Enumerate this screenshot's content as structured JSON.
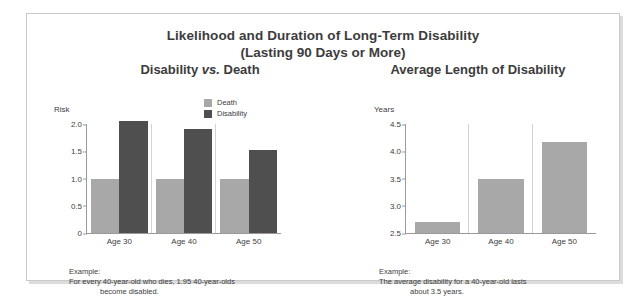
{
  "panel": {
    "title_line1": "Likelihood and Duration of Long-Term Disability",
    "title_line2": "(Lasting 90 Days or More)"
  },
  "legend": {
    "items": [
      {
        "label": "Death",
        "color": "#a8a8a8",
        "key": "death"
      },
      {
        "label": "Disability",
        "color": "#4f4f4f",
        "key": "disability"
      }
    ]
  },
  "left_chart": {
    "heading_part1": "Disability ",
    "heading_vs": "vs.",
    "heading_part2": " Death",
    "caption_label": "Example:",
    "caption_line1": "For every 40-year-old who dies, 1.95 40-year-olds",
    "caption_line2": "become disabled."
  },
  "right_chart": {
    "heading": "Average Length of Disability",
    "caption_label": "Example:",
    "caption_line1": "The average disability for a 40-year-old lasts",
    "caption_line2": "about 3.5 years."
  },
  "chart_data": [
    {
      "id": "disability-vs-death",
      "type": "bar",
      "title": "Disability vs. Death",
      "xlabel": "",
      "ylabel": "Risk",
      "ylim": [
        0,
        2.0
      ],
      "yticks": [
        "2.0",
        "1.5",
        "1.0",
        "0.5",
        "0"
      ],
      "ytick_values": [
        2.0,
        1.5,
        1.0,
        0.5,
        0
      ],
      "grid": false,
      "legend_position": "top-center",
      "categories": [
        "Age 30",
        "Age 40",
        "Age 50"
      ],
      "series": [
        {
          "name": "Death",
          "color": "#a8a8a8",
          "values": [
            1.0,
            1.0,
            1.0
          ]
        },
        {
          "name": "Disability",
          "color": "#4f4f4f",
          "values": [
            2.05,
            1.9,
            1.52
          ]
        }
      ]
    },
    {
      "id": "average-length-of-disability",
      "type": "bar",
      "title": "Average Length of Disability",
      "xlabel": "",
      "ylabel": "Years",
      "ylim": [
        2.5,
        4.5
      ],
      "yticks": [
        "4.5",
        "4.0",
        "3.5",
        "3.0",
        "2.5"
      ],
      "ytick_values": [
        4.5,
        4.0,
        3.5,
        3.0,
        2.5
      ],
      "grid": false,
      "legend_position": "none",
      "categories": [
        "Age 30",
        "Age 40",
        "Age 50"
      ],
      "series": [
        {
          "name": "Years",
          "color": "#a8a8a8",
          "values": [
            2.7,
            3.5,
            4.17
          ]
        }
      ]
    }
  ]
}
